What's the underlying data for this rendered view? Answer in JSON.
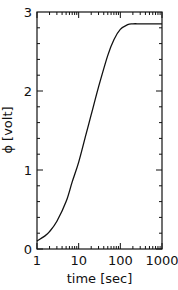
{
  "chart_data": {
    "type": "line",
    "title": "",
    "xlabel": "time [sec]",
    "ylabel": "ϕ [volt]",
    "xscale": "log",
    "xlim": [
      1,
      1000
    ],
    "ylim": [
      0,
      3
    ],
    "xticks": [
      "1",
      "10",
      "100",
      "1000"
    ],
    "yticks": [
      "0",
      "1",
      "2",
      "3"
    ],
    "grid": false,
    "series": [
      {
        "name": "phi",
        "x": [
          1,
          1.5,
          2,
          3,
          5,
          7,
          10,
          15,
          20,
          30,
          50,
          70,
          100,
          150,
          200,
          300,
          500,
          1000
        ],
        "y": [
          0.1,
          0.16,
          0.22,
          0.35,
          0.6,
          0.85,
          1.1,
          1.45,
          1.7,
          2.05,
          2.45,
          2.65,
          2.78,
          2.84,
          2.85,
          2.85,
          2.85,
          2.85
        ]
      }
    ]
  }
}
